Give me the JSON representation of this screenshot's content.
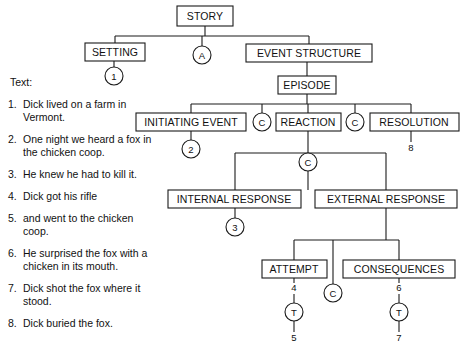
{
  "diagram": {
    "nodes": [
      {
        "id": "story",
        "label": "STORY",
        "kind": "box",
        "x": 177,
        "y": 6,
        "w": 56,
        "h": 20
      },
      {
        "id": "setting",
        "label": "SETTING",
        "kind": "box",
        "x": 85,
        "y": 43,
        "w": 60,
        "h": 18
      },
      {
        "id": "a-circle",
        "label": "A",
        "kind": "circle",
        "cx": 202,
        "cy": 55,
        "r": 9
      },
      {
        "id": "event-structure",
        "label": "EVENT STRUCTURE",
        "kind": "box",
        "x": 246,
        "y": 44,
        "w": 126,
        "h": 18
      },
      {
        "id": "setting-1",
        "label": "1",
        "kind": "circle",
        "cx": 114,
        "cy": 76,
        "r": 9
      },
      {
        "id": "episode",
        "label": "EPISODE",
        "kind": "box",
        "x": 278,
        "y": 76,
        "w": 58,
        "h": 18
      },
      {
        "id": "initiating-event",
        "label": "INITIATING EVENT",
        "kind": "box",
        "x": 136,
        "y": 113,
        "w": 110,
        "h": 18
      },
      {
        "id": "c-circle-1",
        "label": "C",
        "kind": "circle",
        "cx": 262,
        "cy": 122,
        "r": 9
      },
      {
        "id": "reaction",
        "label": "REACTION",
        "kind": "box",
        "x": 276,
        "y": 113,
        "w": 65,
        "h": 18
      },
      {
        "id": "c-circle-2",
        "label": "C",
        "kind": "circle",
        "cx": 355,
        "cy": 122,
        "r": 9
      },
      {
        "id": "resolution",
        "label": "RESOLUTION",
        "kind": "box",
        "x": 370,
        "y": 113,
        "w": 89,
        "h": 18
      },
      {
        "id": "initiating-2",
        "label": "2",
        "kind": "circle",
        "cx": 191,
        "cy": 149,
        "r": 9
      },
      {
        "id": "resolution-8",
        "label": "8",
        "kind": "plain",
        "cx": 411,
        "cy": 148
      },
      {
        "id": "c-circle-3",
        "label": "C",
        "kind": "circle",
        "cx": 308,
        "cy": 162,
        "r": 9
      },
      {
        "id": "internal-response",
        "label": "INTERNAL RESPONSE",
        "kind": "box",
        "x": 168,
        "y": 190,
        "w": 133,
        "h": 18
      },
      {
        "id": "external-response",
        "label": "EXTERNAL RESPONSE",
        "kind": "box",
        "x": 315,
        "y": 190,
        "w": 142,
        "h": 18
      },
      {
        "id": "internal-3",
        "label": "3",
        "kind": "circle",
        "cx": 235,
        "cy": 227,
        "r": 9
      },
      {
        "id": "attempt",
        "label": "ATTEMPT",
        "kind": "box",
        "x": 262,
        "y": 260,
        "w": 65,
        "h": 18
      },
      {
        "id": "consequences",
        "label": "CONSEQUENCES",
        "kind": "box",
        "x": 343,
        "y": 260,
        "w": 112,
        "h": 18
      },
      {
        "id": "attempt-4",
        "label": "4",
        "kind": "plain",
        "cx": 294,
        "cy": 288
      },
      {
        "id": "c-circle-4",
        "label": "C",
        "kind": "circle",
        "cx": 333,
        "cy": 293,
        "r": 9
      },
      {
        "id": "consequences-6",
        "label": "6",
        "kind": "plain",
        "cx": 399,
        "cy": 288
      },
      {
        "id": "attempt-t",
        "label": "T",
        "kind": "circle",
        "cx": 294,
        "cy": 312,
        "r": 9
      },
      {
        "id": "consequences-t",
        "label": "T",
        "kind": "circle",
        "cx": 399,
        "cy": 312,
        "r": 9
      },
      {
        "id": "attempt-5",
        "label": "5",
        "kind": "plain",
        "cx": 294,
        "cy": 338
      },
      {
        "id": "consequences-7",
        "label": "7",
        "kind": "plain",
        "cx": 399,
        "cy": 338
      }
    ]
  },
  "text_panel": {
    "heading": "Text:",
    "items": [
      {
        "number": "1.",
        "sentence": "Dick lived on a farm in Vermont."
      },
      {
        "number": "2.",
        "sentence": "One night we heard a fox in the chicken coop."
      },
      {
        "number": "3.",
        "sentence": "He knew he had to kill it."
      },
      {
        "number": "4.",
        "sentence": "Dick got his rifle"
      },
      {
        "number": "5.",
        "sentence": "and went to the chicken coop."
      },
      {
        "number": "6.",
        "sentence": "He surprised the fox with a chicken in its mouth."
      },
      {
        "number": "7.",
        "sentence": "Dick shot the fox where it stood."
      },
      {
        "number": "8.",
        "sentence": "Dick buried the fox."
      }
    ]
  },
  "colors": {
    "ink": "#111111",
    "stroke": "#1a1a1a",
    "background": "#ffffff"
  }
}
